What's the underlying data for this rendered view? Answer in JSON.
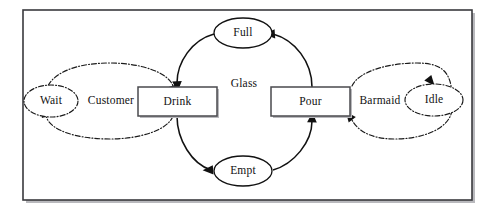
{
  "diagram": {
    "type": "petri-net",
    "title_visible": false,
    "frame": {
      "x": 23,
      "y": 10,
      "width": 449,
      "height": 190,
      "border_color": "#3a3a3e",
      "background_color": "#ffffff"
    },
    "places": [
      {
        "id": "full",
        "label": "Full",
        "cx": 243,
        "cy": 33,
        "rx": 29,
        "ry": 15,
        "style": "solid"
      },
      {
        "id": "empt",
        "label": "Empt",
        "cx": 243,
        "cy": 171,
        "rx": 29,
        "ry": 15,
        "style": "solid"
      },
      {
        "id": "wait",
        "label": "Wait",
        "cx": 51,
        "cy": 101,
        "rx": 27,
        "ry": 16,
        "style": "dash-dot"
      },
      {
        "id": "idle",
        "label": "Idle",
        "cx": 434,
        "cy": 100,
        "rx": 29,
        "ry": 16,
        "style": "dash-dot"
      }
    ],
    "transitions": [
      {
        "id": "drink",
        "label": "Drink",
        "x": 138,
        "y": 87,
        "width": 79,
        "height": 29
      },
      {
        "id": "pour",
        "label": "Pour",
        "x": 271,
        "y": 87,
        "width": 79,
        "height": 29
      }
    ],
    "edge_labels": [
      {
        "id": "customer",
        "label": "Customer",
        "x": 111,
        "y": 101
      },
      {
        "id": "glass",
        "label": "Glass",
        "x": 244,
        "y": 84
      },
      {
        "id": "barmaid",
        "label": "Barmaid",
        "x": 380,
        "y": 101
      }
    ],
    "resource_loops": [
      {
        "id": "customer-loop",
        "label": "Customer",
        "cx": 110,
        "cy": 101,
        "rx": 68,
        "ry": 38,
        "style": "dash-dot"
      },
      {
        "id": "barmaid-loop",
        "label": "Barmaid",
        "cx": 381,
        "cy": 101,
        "rx": 71,
        "ry": 38,
        "style": "dash-dot"
      }
    ],
    "arcs": [
      {
        "id": "pour-to-full",
        "from": "pour",
        "to": "full",
        "style": "solid",
        "arrowhead": true
      },
      {
        "id": "full-to-drink",
        "from": "full",
        "to": "drink",
        "style": "solid",
        "arrowhead": true
      },
      {
        "id": "drink-to-empt",
        "from": "drink",
        "to": "empt",
        "style": "solid",
        "arrowhead": true
      },
      {
        "id": "empt-to-pour",
        "from": "empt",
        "to": "pour",
        "style": "solid",
        "arrowhead": true
      },
      {
        "id": "drink-to-wait",
        "from": "drink",
        "to": "wait",
        "style": "dash-dot",
        "arrowhead": true
      },
      {
        "id": "wait-to-drink",
        "from": "wait",
        "to": "drink",
        "style": "dash-dot",
        "arrowhead": true
      },
      {
        "id": "pour-to-idle",
        "from": "pour",
        "to": "idle",
        "style": "dash-dot",
        "arrowhead": true
      },
      {
        "id": "idle-to-pour",
        "from": "idle",
        "to": "pour",
        "style": "dash-dot",
        "arrowhead": true
      }
    ],
    "colors": {
      "stroke": "#111111",
      "frame": "#3a3a3e",
      "shadow": "#b9b9bd",
      "background": "#ffffff"
    }
  }
}
